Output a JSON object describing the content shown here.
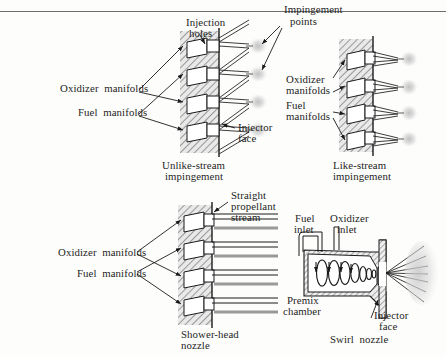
{
  "figure": {
    "kind": "rocket-engine-injector-types-diagram",
    "background": "#fdfdfc",
    "rule_color": "#6e6e6e",
    "hatch_color": "#5a5a5a",
    "line_color": "#1a1a1a",
    "spray_color": "#cfcfcf",
    "stream_color": "#9a9a9a"
  },
  "labels": {
    "impingement_points_l1": "Impingement",
    "impingement_points_l2": "points",
    "injection_holes_l1": "Injection",
    "injection_holes_l2": "holes",
    "oxidizer_manifolds_left": "Oxidizer  manifolds",
    "fuel_manifolds_left": "Fuel  manifolds",
    "injector_face_l1": "Injector",
    "injector_face_l2": "face",
    "oxidizer_manifolds_right_l1": "Oxidizer",
    "oxidizer_manifolds_right_l2": "manifolds",
    "fuel_manifolds_right_l1": "Fuel",
    "fuel_manifolds_right_l2": "manifolds",
    "straight_stream_l1": "Straight",
    "straight_stream_l2": "propellant",
    "straight_stream_l3": "stream",
    "oxidizer_manifolds_shower": "Oxidizer  manifolds",
    "fuel_manifolds_shower": "Fuel  manifolds",
    "fuel_inlet_l1": "Fuel",
    "fuel_inlet_l2": "inlet",
    "oxidizer_inlet_l1": "Oxidizer",
    "oxidizer_inlet_l2": "inlet",
    "premix_chamber_l1": "Premix",
    "premix_chamber_l2": "chamber",
    "injector_face_swirl_l1": "Injector",
    "injector_face_swirl_l2": "face"
  },
  "captions": {
    "unlike_stream_l1": "Unlike-stream",
    "unlike_stream_l2": "impingement",
    "like_stream_l1": "Like-stream",
    "like_stream_l2": "impingement",
    "shower_head_l1": "Shower-head",
    "shower_head_l2": "nozzle",
    "swirl_nozzle": "Swirl  nozzle"
  },
  "panels": [
    {
      "id": "unlike-stream-impingement",
      "caption": "Unlike-stream impingement",
      "manifold_count": 4,
      "description": "Injector plate with alternating oxidizer and fuel manifolds whose jets cross at impingement points beyond the injector face"
    },
    {
      "id": "like-stream-impingement",
      "caption": "Like-stream impingement",
      "manifold_count": 4,
      "description": "Each manifold feeds a pair of like-propellant jets that impinge on each other"
    },
    {
      "id": "shower-head-nozzle",
      "caption": "Shower-head nozzle",
      "manifold_count": 4,
      "description": "Parallel non-impinging straight propellant streams issuing from the injector face"
    },
    {
      "id": "swirl-nozzle",
      "caption": "Swirl nozzle",
      "description": "Fuel and oxidizer inlets feed a premix chamber with a swirling vortex that discharges as a conical spray at the injector face"
    }
  ]
}
